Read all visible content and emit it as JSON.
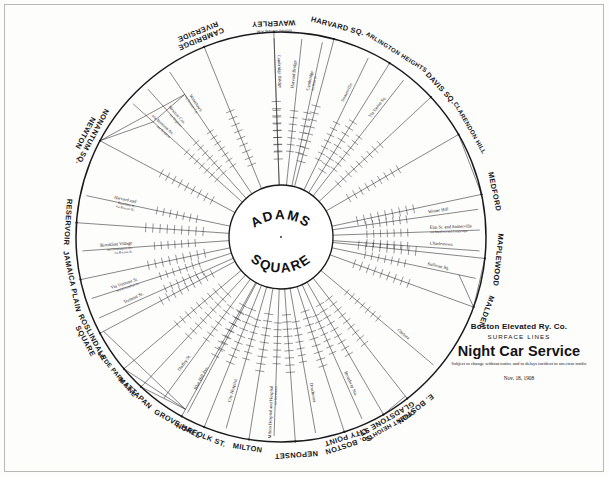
{
  "document": {
    "hub_line1": "ADAMS",
    "hub_line2": "SQUARE"
  },
  "title_block": {
    "company": "Boston Elevated Ry. Co.",
    "division": "SURFACE LINES",
    "main_title": "Night Car Service",
    "disclaimer": "Subject to change without notice  and to delays incident to streetcar traffic",
    "date": "Nov. 18, 1908"
  },
  "chart_data": {
    "type": "diagram",
    "title": "Night Car Service",
    "subtitle": "Boston Elevated Ry. Co. — Surface Lines",
    "center_hub": "Adams Square",
    "layout": "radial spokes from a central hub to an outer terminal ring",
    "terminals": [
      {
        "name": "NONANTUM SQ.",
        "name2": "NEWTON",
        "angle_deg": 208
      },
      {
        "name": "CAMBRIDGE",
        "name2": "RIVERSIDE",
        "angle_deg": 248
      },
      {
        "name": "WAVERLEY",
        "note": "omitted Sunday A.M.",
        "angle_deg": 268
      },
      {
        "name": "HARVARD SQ.",
        "angle_deg": 285
      },
      {
        "name": "ARLINGTON HEIGHTS",
        "angle_deg": 302
      },
      {
        "name": "DAVIS SQ.",
        "angle_deg": 317
      },
      {
        "name": "CLARENDON HILL",
        "angle_deg": 330
      },
      {
        "name": "MEDFORD",
        "angle_deg": 348
      },
      {
        "name": "MAPLEWOOD",
        "angle_deg": 6
      },
      {
        "name": "MALDEN",
        "angle_deg": 20
      },
      {
        "name": "E. BOSTON",
        "angle_deg": 52
      },
      {
        "name": "ORIENT HEIGHTS",
        "name2": "GLADSTONE ST.",
        "angle_deg": 60
      },
      {
        "name": "So. BOSTON",
        "name2": "CITY POINT",
        "angle_deg": 72
      },
      {
        "name": "NEPONSET",
        "angle_deg": 86
      },
      {
        "name": "MILTON",
        "angle_deg": 99
      },
      {
        "name": "NORFOLK ST.",
        "angle_deg": 112
      },
      {
        "name": "GROVE HALL",
        "angle_deg": 119
      },
      {
        "name": "MATTAPAN",
        "angle_deg": 133
      },
      {
        "name": "HYDE PARK LINE",
        "angle_deg": 140
      },
      {
        "name": "ROSLINDALE",
        "name2": "SQUARE",
        "angle_deg": 152
      },
      {
        "name": "JAMAICA PLAIN",
        "angle_deg": 168
      },
      {
        "name": "RESERVOIR",
        "angle_deg": 184
      }
    ],
    "spoke_routes": [
      {
        "label": "Watertown",
        "sub": "via Newton Cor.",
        "angle_deg": 236
      },
      {
        "label": "Newton Cor.",
        "sub": "via Brighton",
        "angle_deg": 228
      },
      {
        "label": "via Western Av.",
        "sub": "and Brighton",
        "angle_deg": 222
      },
      {
        "label": "Cambridge Bridge",
        "angle_deg": 268
      },
      {
        "label": "Harvard Bridge",
        "angle_deg": 276
      },
      {
        "label": "Cambridge",
        "sub": "via Main St.",
        "angle_deg": 282
      },
      {
        "label": "Somerville",
        "angle_deg": 296
      },
      {
        "label": "Via Union Sq.",
        "angle_deg": 308
      },
      {
        "label": "Winter Hill",
        "angle_deg": 352
      },
      {
        "label": "Elm St. and Somerville",
        "sub": "via Medford and Cambridge",
        "angle_deg": 358
      },
      {
        "label": "Charlestown",
        "angle_deg": 4
      },
      {
        "label": "Sullivan Sq.",
        "angle_deg": 12
      },
      {
        "label": "Chelsea",
        "angle_deg": 40
      },
      {
        "label": "Broadway Sta.",
        "angle_deg": 66
      },
      {
        "label": "Dorchester",
        "angle_deg": 80
      },
      {
        "label": "Milton Hospital and Hospital",
        "sub": "via Dorchester",
        "angle_deg": 92
      },
      {
        "label": "City Hospital",
        "angle_deg": 106
      },
      {
        "label": "Blue Hill Ave.",
        "angle_deg": 118
      },
      {
        "label": "Dudley St.",
        "angle_deg": 126
      },
      {
        "label": "Tremont St.",
        "angle_deg": 156
      },
      {
        "label": "Via Tremont St.",
        "sub": "and Columbus Av.",
        "angle_deg": 162
      },
      {
        "label": "Brookline Village",
        "sub": "and Huntington Av.",
        "sub2": "via Boston St.",
        "angle_deg": 176
      },
      {
        "label": "Harvard and",
        "sub": "Brookline St.",
        "sub2": "via Beacon St.",
        "angle_deg": 192
      }
    ],
    "notes": [
      "Times are shown in small vertical columns alongside each radial route line.",
      "WAVERLEY service omitted Sunday A.M."
    ]
  }
}
